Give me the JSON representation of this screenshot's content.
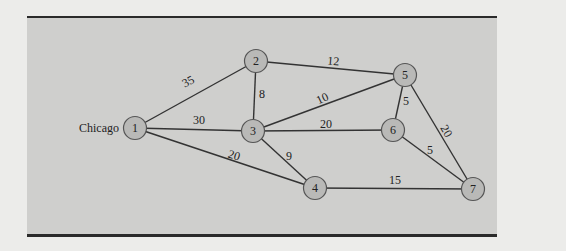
{
  "diagram": {
    "type": "network",
    "colors": {
      "panel": "#cfcfcd",
      "node_fill": "#b9b9b7",
      "edge": "#333333",
      "rule": "#2a2a2a"
    },
    "source_label": {
      "text": "Chicago",
      "node": "1"
    },
    "nodes": [
      {
        "id": "1",
        "label": "1",
        "x": 135,
        "y": 128
      },
      {
        "id": "2",
        "label": "2",
        "x": 256,
        "y": 61
      },
      {
        "id": "3",
        "label": "3",
        "x": 253,
        "y": 131
      },
      {
        "id": "4",
        "label": "4",
        "x": 315,
        "y": 188
      },
      {
        "id": "5",
        "label": "5",
        "x": 405,
        "y": 75
      },
      {
        "id": "6",
        "label": "6",
        "x": 393,
        "y": 130
      },
      {
        "id": "7",
        "label": "7",
        "x": 473,
        "y": 189
      }
    ],
    "edges": [
      {
        "from": "1",
        "to": "2",
        "weight": "35",
        "lx": 190,
        "ly": 85,
        "rot": -28
      },
      {
        "from": "1",
        "to": "3",
        "weight": "30",
        "lx": 199,
        "ly": 124,
        "rot": 0
      },
      {
        "from": "1",
        "to": "4",
        "weight": "20",
        "lx": 233,
        "ly": 159,
        "rot": 17
      },
      {
        "from": "2",
        "to": "3",
        "weight": "8",
        "lx": 262,
        "ly": 98,
        "rot": 0
      },
      {
        "from": "2",
        "to": "5",
        "weight": "12",
        "lx": 333,
        "ly": 65,
        "rot": 5
      },
      {
        "from": "3",
        "to": "5",
        "weight": "10",
        "lx": 324,
        "ly": 102,
        "rot": -25
      },
      {
        "from": "3",
        "to": "6",
        "weight": "20",
        "lx": 326,
        "ly": 128,
        "rot": 0
      },
      {
        "from": "3",
        "to": "4",
        "weight": "9",
        "lx": 289,
        "ly": 160,
        "rot": 0
      },
      {
        "from": "5",
        "to": "6",
        "weight": "5",
        "lx": 406,
        "ly": 105,
        "rot": 0
      },
      {
        "from": "5",
        "to": "7",
        "weight": "20",
        "lx": 443,
        "ly": 133,
        "rot": 60
      },
      {
        "from": "6",
        "to": "7",
        "weight": "5",
        "lx": 430,
        "ly": 154,
        "rot": 0
      },
      {
        "from": "4",
        "to": "7",
        "weight": "15",
        "lx": 395,
        "ly": 184,
        "rot": 0
      }
    ]
  }
}
